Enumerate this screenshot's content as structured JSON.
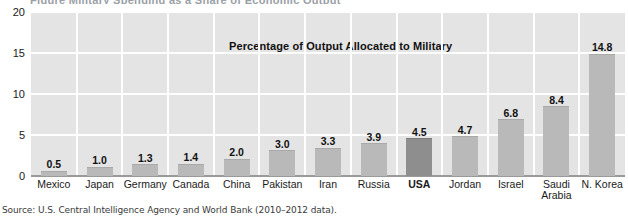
{
  "top_cropped_text": "Figure  Military Spending as a Share of Economic Output",
  "source_note": "Source: U.S. Central Intelligence Agency and World Bank (2010–2012 data).",
  "chart_data": {
    "type": "bar",
    "title": "Percentage of Output Allocated to Military",
    "xlabel": "",
    "ylabel": "",
    "ylim": [
      0,
      20
    ],
    "yticks": [
      0,
      5,
      10,
      15,
      20
    ],
    "grid": true,
    "legend": "none",
    "categories": [
      "Mexico",
      "Japan",
      "Germany",
      "Canada",
      "China",
      "Pakistan",
      "Iran",
      "Russia",
      "USA",
      "Jordan",
      "Israel",
      "Saudi Arabia",
      "N. Korea"
    ],
    "values": [
      0.5,
      1.0,
      1.3,
      1.4,
      2.0,
      3.0,
      3.3,
      3.9,
      4.5,
      4.7,
      6.8,
      8.4,
      14.8
    ],
    "value_labels": [
      "0.5",
      "1.0",
      "1.3",
      "1.4",
      "2.0",
      "3.0",
      "3.3",
      "3.9",
      "4.5",
      "4.7",
      "6.8",
      "8.4",
      "14.8"
    ],
    "highlighted_category": "USA",
    "colors": {
      "bar": "#b9b9b9",
      "bar_highlight": "#8e8e8e",
      "plot_background": "#e4e4e4",
      "gridline": "#ffffff",
      "axis": "#9a9a9a",
      "text": "#111111"
    }
  }
}
